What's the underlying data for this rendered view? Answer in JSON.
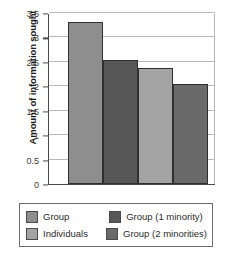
{
  "chart_data": {
    "type": "bar",
    "title": "",
    "xlabel": "",
    "ylabel": "Amount of information sought",
    "ylim": [
      0,
      3.5
    ],
    "yticks": [
      "0",
      "0.5",
      "1",
      "1.5",
      "2",
      "2.5",
      "3",
      "3.5"
    ],
    "ytick_values": [
      0,
      0.5,
      1,
      1.5,
      2,
      2.5,
      3,
      3.5
    ],
    "grid": true,
    "legend_position": "bottom",
    "categories": [
      "Group",
      "Group (1 minority)",
      "Individuals",
      "Group (2 minorities)"
    ],
    "values": [
      3.31,
      2.53,
      2.38,
      2.04
    ],
    "bar_colors": [
      "#8e8e8e",
      "#575757",
      "#a3a3a3",
      "#6a6a6a"
    ]
  },
  "legend": {
    "entries": [
      {
        "label": "Group",
        "color": "#8e8e8e"
      },
      {
        "label": "Group (1 minority)",
        "color": "#575757"
      },
      {
        "label": "Individuals",
        "color": "#a3a3a3"
      },
      {
        "label": "Group (2 minorities)",
        "color": "#6a6a6a"
      }
    ]
  },
  "colors": {
    "axis": "#4a4a4a",
    "grid": "#b9b9b9",
    "bar_outline": "#2f2f2f",
    "legend_border": "#6d6d6d",
    "text": "#2b2b2b",
    "background": "#ffffff"
  }
}
